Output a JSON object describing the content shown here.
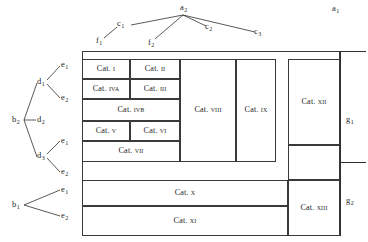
{
  "diagram": {
    "background": "#ffffff",
    "line_color": "#2e2e2e",
    "text_color": "#1f1f1f"
  },
  "top_tree": {
    "root": {
      "label": "a",
      "sub": "2",
      "x": 182,
      "y": 4
    },
    "alt_root": {
      "label": "a",
      "sub": "1",
      "x": 334,
      "y": 5
    },
    "children": [
      {
        "label": "c",
        "sub": "1",
        "x": 120,
        "y": 22
      },
      {
        "label": "c",
        "sub": "2",
        "x": 210,
        "y": 26
      },
      {
        "label": "c",
        "sub": "3",
        "x": 258,
        "y": 30
      }
    ],
    "leaves": [
      {
        "label": "f",
        "sub": "1",
        "x": 98,
        "y": 38
      },
      {
        "label": "f",
        "sub": "2",
        "x": 150,
        "y": 40
      }
    ]
  },
  "left_tree_upper": {
    "root": {
      "label": "b",
      "sub": "2",
      "x": 12,
      "y": 118
    },
    "mid": [
      {
        "label": "d",
        "sub": "1",
        "x": 38,
        "y": 80
      },
      {
        "label": "d",
        "sub": "2",
        "x": 38,
        "y": 118
      },
      {
        "label": "d",
        "sub": "3",
        "x": 38,
        "y": 154
      }
    ],
    "leaves": [
      {
        "label": "e",
        "sub": "1",
        "x": 62,
        "y": 63
      },
      {
        "label": "e",
        "sub": "2",
        "x": 62,
        "y": 96
      },
      {
        "label": "e",
        "sub": "1",
        "x": 62,
        "y": 139
      },
      {
        "label": "e",
        "sub": "2",
        "x": 62,
        "y": 170
      }
    ]
  },
  "left_tree_lower": {
    "root": {
      "label": "b",
      "sub": "1",
      "x": 12,
      "y": 203
    },
    "leaves": [
      {
        "label": "e",
        "sub": "1",
        "x": 62,
        "y": 188
      },
      {
        "label": "e",
        "sub": "2",
        "x": 62,
        "y": 214
      }
    ]
  },
  "right_labels": [
    {
      "label": "g",
      "sub": "1",
      "x": 347,
      "y": 118
    },
    {
      "label": "g",
      "sub": "2",
      "x": 347,
      "y": 199
    }
  ],
  "cells": [
    {
      "name": "cat-1",
      "prefix": "Cat. ",
      "roman": "i",
      "x": 82,
      "y": 59,
      "w": 48,
      "h": 20
    },
    {
      "name": "cat-2",
      "prefix": "Cat. ",
      "roman": "ii",
      "x": 130,
      "y": 59,
      "w": 50,
      "h": 20
    },
    {
      "name": "cat-4a",
      "prefix": "Cat. ",
      "roman": "iva",
      "x": 82,
      "y": 79,
      "w": 48,
      "h": 20
    },
    {
      "name": "cat-3",
      "prefix": "Cat. ",
      "roman": "iii",
      "x": 130,
      "y": 79,
      "w": 50,
      "h": 20
    },
    {
      "name": "cat-4b",
      "prefix": "Cat. ",
      "roman": "ivb",
      "x": 82,
      "y": 99,
      "w": 98,
      "h": 22
    },
    {
      "name": "cat-5",
      "prefix": "Cat. ",
      "roman": "v",
      "x": 82,
      "y": 121,
      "w": 48,
      "h": 20
    },
    {
      "name": "cat-6",
      "prefix": "Cat. ",
      "roman": "vi",
      "x": 130,
      "y": 121,
      "w": 50,
      "h": 20
    },
    {
      "name": "cat-7",
      "prefix": "Cat. ",
      "roman": "vii",
      "x": 82,
      "y": 141,
      "w": 98,
      "h": 21
    },
    {
      "name": "cat-8",
      "prefix": "Cat. ",
      "roman": "viii",
      "x": 180,
      "y": 59,
      "w": 56,
      "h": 103
    },
    {
      "name": "cat-9",
      "prefix": "Cat. ",
      "roman": "ix",
      "x": 236,
      "y": 59,
      "w": 40,
      "h": 103
    },
    {
      "name": "cat-12",
      "prefix": "Cat. ",
      "roman": "xii",
      "x": 288,
      "y": 59,
      "w": 52,
      "h": 86
    },
    {
      "name": "cat-13",
      "prefix": "Cat. ",
      "roman": "xiii",
      "x": 288,
      "y": 180,
      "w": 52,
      "h": 56
    },
    {
      "name": "cat-10",
      "prefix": "Cat. ",
      "roman": "x",
      "x": 82,
      "y": 180,
      "w": 206,
      "h": 26
    },
    {
      "name": "cat-11",
      "prefix": "Cat. ",
      "roman": "xi",
      "x": 82,
      "y": 206,
      "w": 206,
      "h": 30
    }
  ]
}
